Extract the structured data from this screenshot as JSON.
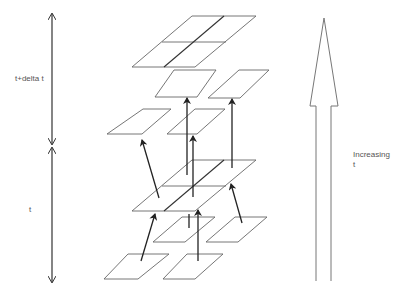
{
  "diagram": {
    "left_axis": {
      "upper_label": "t+delta t",
      "lower_label": "t"
    },
    "right_arrow": {
      "label_line1": "Increasing",
      "label_line2": "t"
    },
    "colors": {
      "line": "#444444",
      "arrow": "#222222",
      "text": "#555555",
      "background": "#ffffff"
    },
    "levels": [
      {
        "name": "t+delta t",
        "cells": [
          "top-2x2-grid",
          "mid-left",
          "mid-right",
          "low-left",
          "low-center"
        ]
      },
      {
        "name": "t",
        "cells": [
          "center-2x2-grid",
          "inner-left",
          "inner-right",
          "bottom-left",
          "bottom-right"
        ]
      }
    ]
  }
}
